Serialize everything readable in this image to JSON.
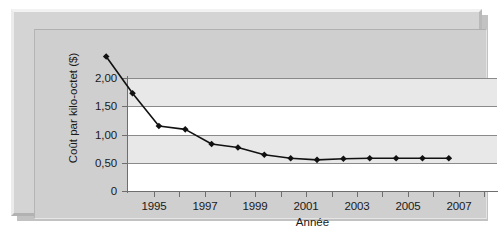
{
  "chart_data": {
    "type": "line",
    "title": "",
    "xlabel": "Année",
    "ylabel": "Coût par kilo-octet ($)",
    "x": [
      1995,
      1996,
      1997,
      1998,
      1999,
      2000,
      2001,
      2002,
      2003,
      2004,
      2005,
      2006,
      2007,
      2008
    ],
    "values": [
      1.85,
      1.2,
      0.62,
      0.56,
      0.3,
      0.24,
      0.11,
      0.05,
      0.02,
      0.04,
      0.05,
      0.05,
      0.05,
      0.05
    ],
    "series": [
      {
        "name": "Coût par kilo-octet ($)",
        "values": [
          1.85,
          1.2,
          0.62,
          0.56,
          0.3,
          0.24,
          0.11,
          0.05,
          0.02,
          0.04,
          0.05,
          0.05,
          0.05,
          0.05
        ]
      }
    ],
    "xlim": [
      1994.5,
      2008.5
    ],
    "ylim": [
      0,
      2.0
    ],
    "ytick_values": [
      2.0,
      1.5,
      1.0,
      0.5,
      0
    ],
    "ytick_labels": [
      "2,00",
      "1,50",
      "1,00",
      "0,50",
      "0"
    ],
    "xtick_values": [
      1995,
      1997,
      1999,
      2001,
      2003,
      2005,
      2007
    ],
    "xtick_labels": [
      "1995",
      "1997",
      "1999",
      "2001",
      "2003",
      "2005",
      "2007"
    ],
    "grid": true,
    "grid_axis": "y",
    "legend": false,
    "legend_position": "none",
    "marker": "diamond",
    "line_color": "#111111",
    "marker_color": "#111111",
    "plot_background": "#ffffff",
    "band_color": "#e8e8e8",
    "panel_background": "#cfcfcf",
    "frame_color": "#d4d4d4"
  }
}
